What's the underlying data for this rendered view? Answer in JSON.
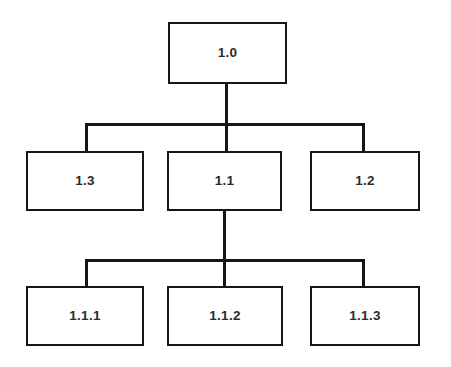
{
  "diagram": {
    "type": "hierarchy-tree",
    "title": "",
    "background_color": "#ffffff",
    "line_color": "#161616",
    "text_color": "#2b2b2b",
    "box_fill_color": "#ffffff",
    "levels": 3,
    "nodes": {
      "root": {
        "label": "1.0"
      },
      "level1": [
        {
          "label": "1.3"
        },
        {
          "label": "1.1"
        },
        {
          "label": "1.2"
        }
      ],
      "level2": [
        {
          "label": "1.1.1"
        },
        {
          "label": "1.1.2"
        },
        {
          "label": "1.1.3"
        }
      ]
    },
    "edges": [
      {
        "from": "1.0",
        "to": "1.3"
      },
      {
        "from": "1.0",
        "to": "1.1"
      },
      {
        "from": "1.0",
        "to": "1.2"
      },
      {
        "from": "1.1",
        "to": "1.1.1"
      },
      {
        "from": "1.1",
        "to": "1.1.2"
      },
      {
        "from": "1.1",
        "to": "1.1.3"
      }
    ]
  }
}
